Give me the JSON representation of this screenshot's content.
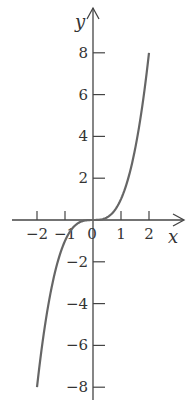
{
  "chart_data": {
    "type": "line",
    "title": "",
    "xlabel": "x",
    "ylabel": "y",
    "xlim": [
      -2.2,
      2.6
    ],
    "ylim": [
      -8.5,
      9.5
    ],
    "grid": false,
    "legend": null,
    "x_ticks": [
      -2,
      -1,
      0,
      1,
      2
    ],
    "x_tick_labels": [
      "−2",
      "−1",
      "0",
      "1",
      "2"
    ],
    "y_ticks": [
      -8,
      -6,
      -4,
      -2,
      2,
      4,
      6,
      8
    ],
    "y_tick_labels": [
      "−8",
      "−6",
      "−4",
      "−2",
      "2",
      "4",
      "6",
      "8"
    ],
    "series": [
      {
        "name": "y = x^3",
        "function": "x^3",
        "x": [
          -2,
          -1.5,
          -1,
          -0.5,
          0,
          0.5,
          1,
          1.5,
          2
        ],
        "y": [
          -8,
          -3.375,
          -1,
          -0.125,
          0,
          0.125,
          1,
          3.375,
          8
        ],
        "color": "#666666"
      }
    ],
    "axis_color": "#444444"
  }
}
